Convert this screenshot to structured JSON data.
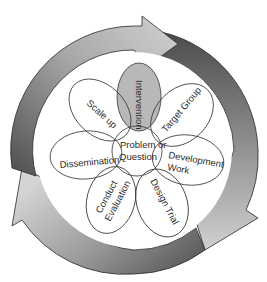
{
  "diagram": {
    "type": "cycle-flower",
    "center": {
      "label_line1": "Problem or",
      "label_line2": "Question"
    },
    "petals": [
      {
        "id": "intervention",
        "label": "Intervention",
        "highlighted": true
      },
      {
        "id": "target-group",
        "label": "Target Group"
      },
      {
        "id": "development-work",
        "label_line1": "Development",
        "label_line2": "Work"
      },
      {
        "id": "design-trial",
        "label": "Design Trial"
      },
      {
        "id": "conduct-evaluation",
        "label_line1": "Conduct",
        "label_line2": "Evaluation"
      },
      {
        "id": "dissemination",
        "label": "Dissemination"
      },
      {
        "id": "scale-up",
        "label": "Scale up"
      }
    ],
    "cycle_arrows": [
      {
        "id": "top-arrow",
        "direction": "clockwise"
      },
      {
        "id": "right-arrow",
        "direction": "clockwise"
      },
      {
        "id": "left-arrow",
        "direction": "clockwise"
      }
    ],
    "colors": {
      "ring_dark": "#5a5a5a",
      "ring_light": "#c8c8c8",
      "highlight_petal": "#b8b8b8",
      "stroke": "#333333"
    }
  }
}
